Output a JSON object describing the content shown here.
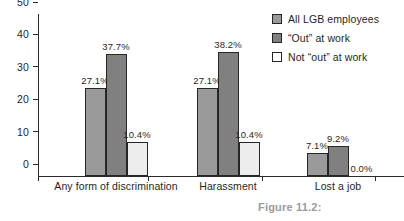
{
  "caption": "Figure 11.2:",
  "chart_data": {
    "type": "bar",
    "title": "",
    "xlabel": "",
    "ylabel": "",
    "ylim": [
      0,
      50
    ],
    "yticks": [
      0,
      10,
      20,
      30,
      40,
      50
    ],
    "grid": false,
    "legend_position": "right",
    "categories": [
      "Any form of discrimination",
      "Harassment",
      "Lost a job"
    ],
    "series": [
      {
        "name": "All LGB employees",
        "color": "#9a9a9a",
        "values": [
          27.1,
          27.1,
          7.1
        ],
        "labels": [
          "27.1%",
          "27.1%",
          "7.1%"
        ]
      },
      {
        "name": "“Out” at work",
        "color": "#808080",
        "values": [
          37.7,
          38.2,
          9.2
        ],
        "labels": [
          "37.7%",
          "38.2%",
          "9.2%"
        ]
      },
      {
        "name": "Not “out” at work",
        "color": "#ededed",
        "values": [
          10.4,
          10.4,
          0.0
        ],
        "labels": [
          "10.4%",
          "10.4%",
          "0.0%"
        ]
      }
    ]
  }
}
